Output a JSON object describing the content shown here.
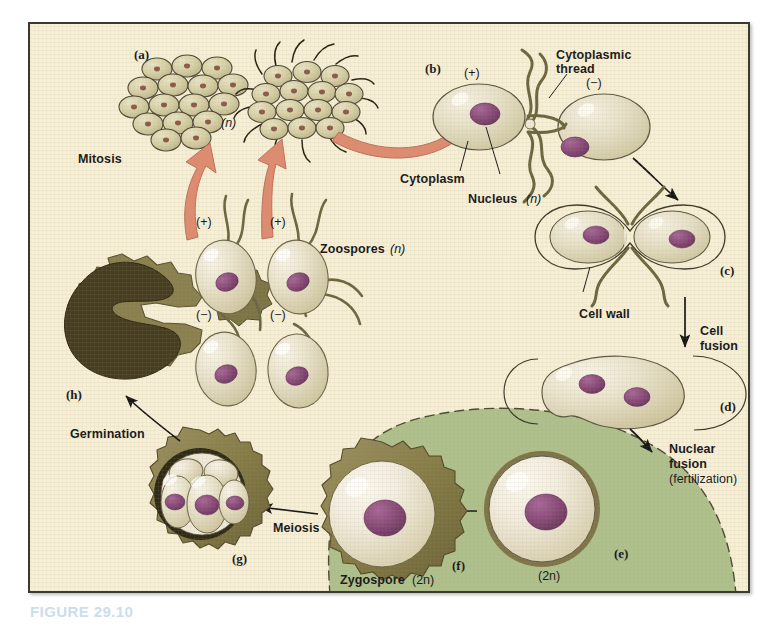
{
  "figure": {
    "caption": "FIGURE  29.10",
    "background_color": "#f6efd6",
    "frame_color": "#3a3a32",
    "arrow_color_mitosis": "#e08a70",
    "arrow_color_default": "#1a1a1a",
    "nucleus_color": "#8b4a7c",
    "cell_body_color": "#e3decb",
    "cell_wall_color": "#6e6b4a",
    "flagella_color": "#6b6540",
    "zygospore_zone_color": "#aec08c",
    "spore_coat_color": "#8a7f4e",
    "germination_dark_color": "#463d22"
  },
  "labels": {
    "mitosis": "Mitosis",
    "zoospores": "Zoospores",
    "zoospores_ploidy": "(n)",
    "colony_ploidy": "(n)",
    "cytoplasmic_thread": "Cytoplasmic\nthread",
    "cytoplasmic_thread_line1": "Cytoplasmic",
    "cytoplasmic_thread_line2": "thread",
    "cytoplasm": "Cytoplasm",
    "nucleus": "Nucleus",
    "nucleus_ploidy": "(n)",
    "cell_wall": "Cell wall",
    "cell_fusion_line1": "Cell",
    "cell_fusion_line2": "fusion",
    "nuclear_fusion_line1": "Nuclear",
    "nuclear_fusion_line2": "fusion",
    "nuclear_fusion_line3": "(fertilization)",
    "meiosis": "Meiosis",
    "germination": "Germination",
    "zygospore": "Zygospore",
    "zygospore_ploidy": "(2n)",
    "e_ploidy": "(2n)",
    "mating_plus": "(+)",
    "mating_minus": "(−)"
  },
  "panel_letters": {
    "a": "(a)",
    "b": "(b)",
    "c": "(c)",
    "d": "(d)",
    "e": "(e)",
    "f": "(f)",
    "g": "(g)",
    "h": "(h)"
  },
  "stages": [
    {
      "id": "a",
      "letter": "(a)",
      "name": "haploid colony / vegetative cells",
      "ploidy": "(n)"
    },
    {
      "id": "b",
      "letter": "(b)",
      "name": "plus and minus gametes joined by cytoplasmic thread",
      "ploidy": "(n)"
    },
    {
      "id": "c",
      "letter": "(c)",
      "name": "gametes in contact, cell walls intact",
      "ploidy": "(n)"
    },
    {
      "id": "d",
      "letter": "(d)",
      "name": "cell fusion, two nuclei, walls shed",
      "ploidy": "(n)"
    },
    {
      "id": "e",
      "letter": "(e)",
      "name": "zygote after nuclear fusion",
      "ploidy": "(2n)"
    },
    {
      "id": "f",
      "letter": "(f)",
      "name": "mature thick-walled zygospore",
      "ploidy": "(2n)"
    },
    {
      "id": "g",
      "letter": "(g)",
      "name": "four haploid cells after meiosis",
      "ploidy": "(n)"
    },
    {
      "id": "h",
      "letter": "(h)",
      "name": "germinating / ruptured spore wall",
      "ploidy": "(n)"
    }
  ],
  "mating_types": {
    "zoospore_top_left": "(+)",
    "zoospore_top_right": "(+)",
    "zoospore_bottom_left": "(−)",
    "zoospore_bottom_right": "(−)",
    "gamete_left": "(+)",
    "gamete_right": "(−)"
  },
  "processes": [
    {
      "name": "Mitosis",
      "arrow_style": "thick-salmon"
    },
    {
      "name": "Cell fusion",
      "arrow_style": "thin-black"
    },
    {
      "name": "Nuclear fusion (fertilization)",
      "arrow_style": "thin-black"
    },
    {
      "name": "Meiosis",
      "arrow_style": "thin-black"
    },
    {
      "name": "Germination",
      "arrow_style": "thin-black"
    }
  ]
}
